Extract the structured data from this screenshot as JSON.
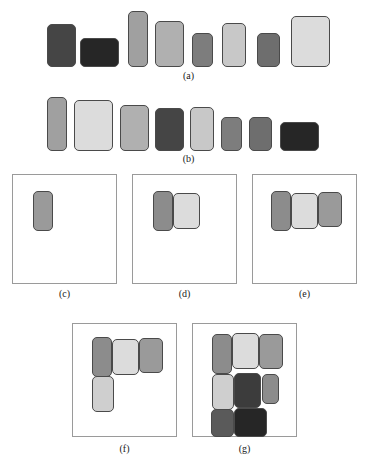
{
  "figure": {
    "width": 370,
    "height": 474,
    "background": "#ffffff",
    "block_border_color": "#4a4a4a",
    "panel_border_color": "#9a9a9a"
  },
  "captions": {
    "a": "(a)",
    "b": "(b)",
    "c": "(c)",
    "d": "(d)",
    "e": "(e)",
    "f": "(f)",
    "g": "(g)"
  },
  "chart_data": {
    "type": "diagram",
    "xlabel": "",
    "ylabel": "",
    "panels": [
      {
        "id": "a",
        "caption": "(a)",
        "kind": "row",
        "note": "input blocks in original order, bottom-aligned",
        "bounds": {
          "x": 47,
          "y": 10,
          "w": 283,
          "h": 58
        },
        "blocks": [
          {
            "index": 1,
            "x": 47,
            "y": 24,
            "w": 29,
            "h": 43,
            "color": "#454545"
          },
          {
            "index": 2,
            "x": 80,
            "y": 38,
            "w": 39,
            "h": 29,
            "color": "#262626"
          },
          {
            "index": 3,
            "x": 128,
            "y": 11,
            "w": 20,
            "h": 56,
            "color": "#a0a0a0"
          },
          {
            "index": 4,
            "x": 155,
            "y": 21,
            "w": 29,
            "h": 46,
            "color": "#b0b0b0"
          },
          {
            "index": 5,
            "x": 192,
            "y": 33,
            "w": 21,
            "h": 34,
            "color": "#7d7d7d"
          },
          {
            "index": 6,
            "x": 222,
            "y": 23,
            "w": 24,
            "h": 44,
            "color": "#c8c8c8"
          },
          {
            "index": 7,
            "x": 257,
            "y": 33,
            "w": 23,
            "h": 34,
            "color": "#6e6e6e"
          },
          {
            "index": 8,
            "x": 291,
            "y": 16,
            "w": 39,
            "h": 51,
            "color": "#dcdcdc"
          }
        ]
      },
      {
        "id": "b",
        "caption": "(b)",
        "kind": "row",
        "note": "blocks sorted by decreasing height, top-aligned",
        "bounds": {
          "x": 47,
          "y": 97,
          "w": 283,
          "h": 54
        },
        "blocks": [
          {
            "index": 1,
            "x": 47,
            "y": 97,
            "w": 20,
            "h": 54,
            "color": "#a0a0a0"
          },
          {
            "index": 2,
            "x": 74,
            "y": 100,
            "w": 39,
            "h": 51,
            "color": "#dcdcdc"
          },
          {
            "index": 3,
            "x": 120,
            "y": 105,
            "w": 29,
            "h": 46,
            "color": "#b0b0b0"
          },
          {
            "index": 4,
            "x": 155,
            "y": 108,
            "w": 29,
            "h": 43,
            "color": "#454545"
          },
          {
            "index": 5,
            "x": 190,
            "y": 107,
            "w": 24,
            "h": 44,
            "color": "#c8c8c8"
          },
          {
            "index": 6,
            "x": 221,
            "y": 117,
            "w": 21,
            "h": 34,
            "color": "#7d7d7d"
          },
          {
            "index": 7,
            "x": 249,
            "y": 117,
            "w": 23,
            "h": 34,
            "color": "#6e6e6e"
          },
          {
            "index": 8,
            "x": 280,
            "y": 122,
            "w": 39,
            "h": 29,
            "color": "#262626"
          }
        ]
      },
      {
        "id": "c",
        "caption": "(c)",
        "kind": "bin",
        "note": "first block placed",
        "bounds": {
          "x": 12,
          "y": 174,
          "w": 105,
          "h": 110
        },
        "blocks": [
          {
            "index": 1,
            "x": 33,
            "y": 191,
            "w": 20,
            "h": 40,
            "color": "#9a9a9a"
          }
        ]
      },
      {
        "id": "d",
        "caption": "(d)",
        "kind": "bin",
        "note": "second block placed to the right",
        "bounds": {
          "x": 132,
          "y": 174,
          "w": 105,
          "h": 110
        },
        "blocks": [
          {
            "index": 1,
            "x": 153,
            "y": 191,
            "w": 20,
            "h": 40,
            "color": "#8c8c8c"
          },
          {
            "index": 2,
            "x": 173,
            "y": 193,
            "w": 27,
            "h": 36,
            "color": "#dcdcdc"
          }
        ]
      },
      {
        "id": "e",
        "caption": "(e)",
        "kind": "bin",
        "note": "third block placed to the right",
        "bounds": {
          "x": 252,
          "y": 174,
          "w": 105,
          "h": 110
        },
        "blocks": [
          {
            "index": 1,
            "x": 271,
            "y": 191,
            "w": 20,
            "h": 40,
            "color": "#8c8c8c"
          },
          {
            "index": 2,
            "x": 291,
            "y": 193,
            "w": 27,
            "h": 36,
            "color": "#dcdcdc"
          },
          {
            "index": 3,
            "x": 318,
            "y": 192,
            "w": 24,
            "h": 35,
            "color": "#9a9a9a"
          }
        ]
      },
      {
        "id": "f",
        "caption": "(f)",
        "kind": "bin",
        "note": "fourth block wraps to second shelf",
        "bounds": {
          "x": 72,
          "y": 323,
          "w": 105,
          "h": 114
        },
        "blocks": [
          {
            "index": 1,
            "x": 92,
            "y": 337,
            "w": 20,
            "h": 40,
            "color": "#8c8c8c"
          },
          {
            "index": 2,
            "x": 112,
            "y": 339,
            "w": 27,
            "h": 36,
            "color": "#dcdcdc"
          },
          {
            "index": 3,
            "x": 139,
            "y": 338,
            "w": 24,
            "h": 35,
            "color": "#9a9a9a"
          },
          {
            "index": 4,
            "x": 92,
            "y": 376,
            "w": 22,
            "h": 36,
            "color": "#cfcfcf"
          }
        ]
      },
      {
        "id": "g",
        "caption": "(g)",
        "kind": "bin",
        "note": "final packing with all blocks placed",
        "bounds": {
          "x": 192,
          "y": 323,
          "w": 105,
          "h": 114
        },
        "blocks": [
          {
            "index": 1,
            "x": 212,
            "y": 334,
            "w": 20,
            "h": 40,
            "color": "#8c8c8c"
          },
          {
            "index": 2,
            "x": 232,
            "y": 333,
            "w": 27,
            "h": 36,
            "color": "#dcdcdc"
          },
          {
            "index": 3,
            "x": 259,
            "y": 334,
            "w": 24,
            "h": 35,
            "color": "#9a9a9a"
          },
          {
            "index": 4,
            "x": 212,
            "y": 374,
            "w": 22,
            "h": 36,
            "color": "#cfcfcf"
          },
          {
            "index": 5,
            "x": 234,
            "y": 373,
            "w": 27,
            "h": 35,
            "color": "#3c3c3c"
          },
          {
            "index": 6,
            "x": 262,
            "y": 374,
            "w": 17,
            "h": 30,
            "color": "#8c8c8c"
          },
          {
            "index": 7,
            "x": 211,
            "y": 409,
            "w": 23,
            "h": 28,
            "color": "#5a5a5a"
          },
          {
            "index": 8,
            "x": 234,
            "y": 408,
            "w": 33,
            "h": 29,
            "color": "#262626"
          }
        ]
      }
    ]
  }
}
